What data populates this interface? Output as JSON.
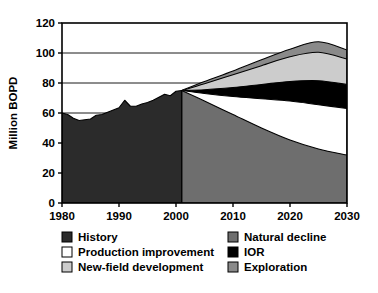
{
  "chart_data": {
    "type": "area",
    "title": "",
    "subtitle": "",
    "xlabel": "",
    "ylabel": "Million BOPD",
    "xlim": [
      1980,
      2030
    ],
    "ylim": [
      0,
      120
    ],
    "grid": true,
    "grid_axis": "y",
    "legend_position": "bottom",
    "legend_columns": 2,
    "xticks": [
      1980,
      1990,
      2000,
      2010,
      2020,
      2030
    ],
    "xtick_labels": [
      "1980",
      "1990",
      "2000",
      "2010",
      "2020",
      "2030"
    ],
    "yticks": [
      0,
      20,
      40,
      60,
      80,
      100,
      120
    ],
    "ytick_labels": [
      "0",
      "20",
      "40",
      "60",
      "80",
      "100",
      "120"
    ],
    "history_end_year": 2001,
    "stacking": "cumulative-from-bottom",
    "series": [
      {
        "name": "History",
        "color": "#2b2b2b",
        "type": "filled-from-zero",
        "x": [
          1980,
          1981,
          1982,
          1983,
          1984,
          1985,
          1986,
          1987,
          1988,
          1989,
          1990,
          1991,
          1992,
          1993,
          1994,
          1995,
          1996,
          1997,
          1998,
          1999,
          2000,
          2001
        ],
        "values": [
          60.0,
          59.0,
          56.5,
          55.0,
          55.5,
          56.0,
          58.5,
          59.0,
          60.5,
          62.0,
          63.5,
          68.5,
          64.5,
          64.5,
          66.0,
          67.0,
          68.5,
          70.5,
          72.5,
          71.5,
          74.5,
          75.0
        ]
      },
      {
        "name": "Natural decline",
        "color": "#6e6e6e",
        "type": "band-cumulative-top",
        "x": [
          2001,
          2005,
          2010,
          2015,
          2020,
          2025,
          2030
        ],
        "values": [
          75.0,
          68.0,
          59.0,
          50.0,
          42.0,
          36.0,
          32.0
        ]
      },
      {
        "name": "Production improvement",
        "color": "#ffffff",
        "type": "band-cumulative-top",
        "x": [
          2001,
          2005,
          2010,
          2015,
          2020,
          2025,
          2030
        ],
        "values": [
          75.0,
          73.0,
          71.0,
          69.5,
          68.0,
          65.5,
          63.0
        ]
      },
      {
        "name": "IOR",
        "color": "#000000",
        "type": "band-cumulative-top",
        "x": [
          2001,
          2005,
          2010,
          2015,
          2020,
          2025,
          2030
        ],
        "values": [
          75.0,
          75.5,
          77.0,
          79.0,
          81.0,
          81.5,
          79.0
        ]
      },
      {
        "name": "New-field development",
        "color": "#cccccc",
        "type": "band-cumulative-top",
        "x": [
          2001,
          2005,
          2010,
          2015,
          2020,
          2025,
          2030
        ],
        "values": [
          75.0,
          79.5,
          85.5,
          91.5,
          97.5,
          100.5,
          96.0
        ]
      },
      {
        "name": "Exploration",
        "color": "#8a8a8a",
        "type": "band-cumulative-top",
        "x": [
          2001,
          2005,
          2010,
          2015,
          2020,
          2025,
          2030
        ],
        "values": [
          75.0,
          81.0,
          88.0,
          95.5,
          102.5,
          107.5,
          102.0
        ]
      }
    ],
    "legend_entries": [
      {
        "label": "History",
        "color": "#2b2b2b",
        "column": 0
      },
      {
        "label": "Production improvement",
        "color": "#ffffff",
        "column": 0
      },
      {
        "label": "New-field development",
        "color": "#cccccc",
        "column": 0
      },
      {
        "label": "Natural decline",
        "color": "#6e6e6e",
        "column": 1
      },
      {
        "label": "IOR",
        "color": "#000000",
        "column": 1
      },
      {
        "label": "Exploration",
        "color": "#8a8a8a",
        "column": 1
      }
    ]
  }
}
